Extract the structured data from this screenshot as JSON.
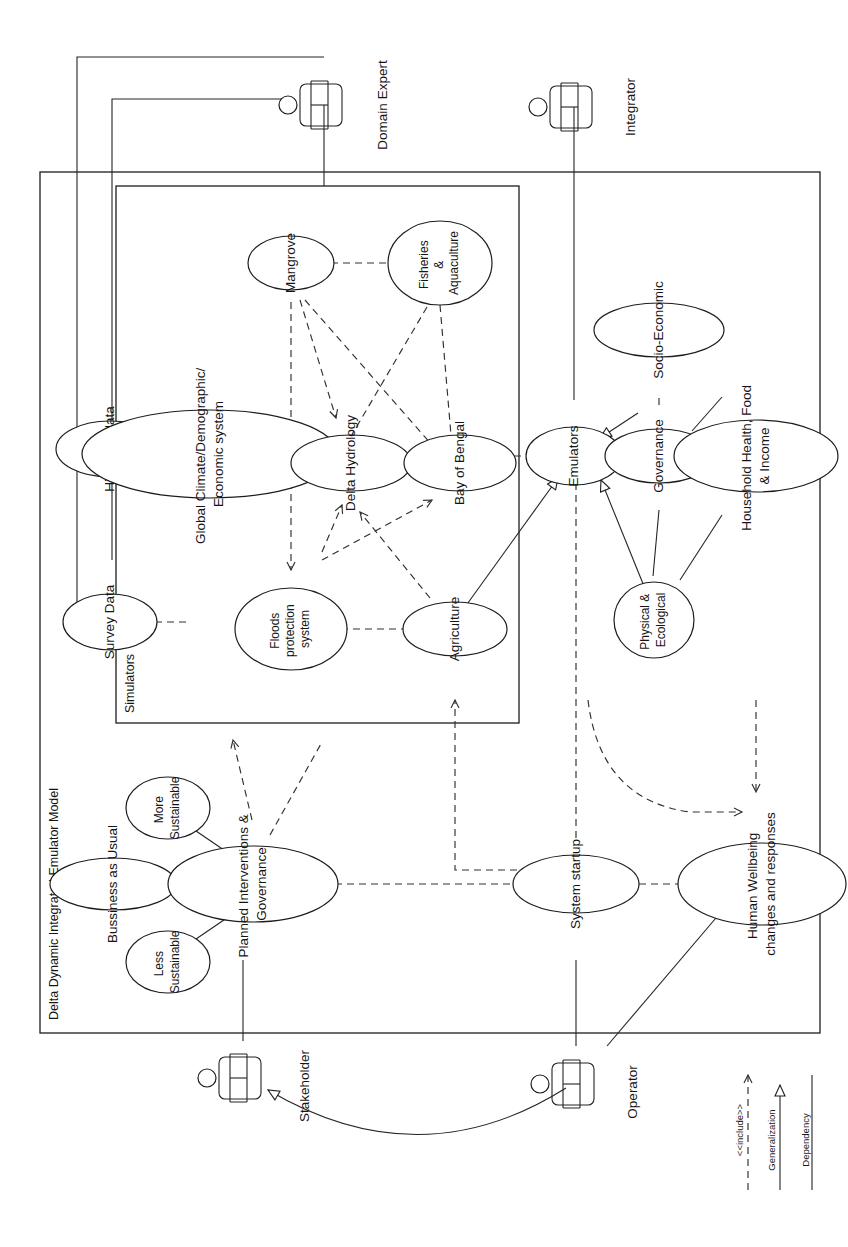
{
  "diagram": {
    "type": "uml-use-case-diagram",
    "orientation_note": "rotated 90 degrees; all text reads bottom-to-top",
    "system_boundary": {
      "label": "Delta Dynamic Integrated Emulator Model"
    },
    "sub_boundary": {
      "label": "Simulators"
    }
  },
  "actors": [
    {
      "id": "domain_expert",
      "label": "Domain Expert"
    },
    {
      "id": "integrator",
      "label": "Integrator"
    },
    {
      "id": "stakeholder",
      "label": "Stakeholder"
    },
    {
      "id": "operator",
      "label": "Operator"
    }
  ],
  "use_cases": {
    "data": [
      {
        "id": "survey_data",
        "label": "Survey Data"
      },
      {
        "id": "historical_data",
        "label": "Historical data"
      }
    ],
    "simulators": [
      {
        "id": "mangrove",
        "label": "Mangrove"
      },
      {
        "id": "fisheries",
        "label": "Fisheries\n&\nAquaculture"
      },
      {
        "id": "global",
        "label": "Global Climate/Demographic/\nEconomic system"
      },
      {
        "id": "hydrology",
        "label": "Delta Hydrology"
      },
      {
        "id": "bay",
        "label": "Bay of Bengal"
      },
      {
        "id": "floods",
        "label": "Floods\nprotection\nsystem"
      },
      {
        "id": "agriculture",
        "label": "Agriculture"
      }
    ],
    "emulators": [
      {
        "id": "emulators",
        "label": "Emulators"
      },
      {
        "id": "socio",
        "label": "Socio-Economic"
      },
      {
        "id": "governance",
        "label": "Governance"
      },
      {
        "id": "household",
        "label": "Household Health, Food\n& Income"
      },
      {
        "id": "physical",
        "label": "Physical &\nEcological"
      }
    ],
    "scenarios": [
      {
        "id": "bau",
        "label": "Bussiness as Usual"
      },
      {
        "id": "more_sust",
        "label": "More\nSustainable"
      },
      {
        "id": "less_sust",
        "label": "Less\nSustainable"
      },
      {
        "id": "planned",
        "label": "Planned Interventions &\nGovernance"
      }
    ],
    "other": [
      {
        "id": "system_startup",
        "label": "System startup"
      },
      {
        "id": "wellbeing",
        "label": "Human Wellbeing\nchanges and responses"
      }
    ]
  },
  "legend": {
    "items": [
      {
        "id": "include",
        "label": "<<include>>",
        "style": "dashed-open-arrow"
      },
      {
        "id": "generalization",
        "label": "Generalization",
        "style": "solid-hollow-triangle"
      },
      {
        "id": "dependency",
        "label": "Dependency",
        "style": "solid-line"
      }
    ]
  },
  "colors": {
    "stroke": "#1d1d1d",
    "background": "#ffffff"
  }
}
